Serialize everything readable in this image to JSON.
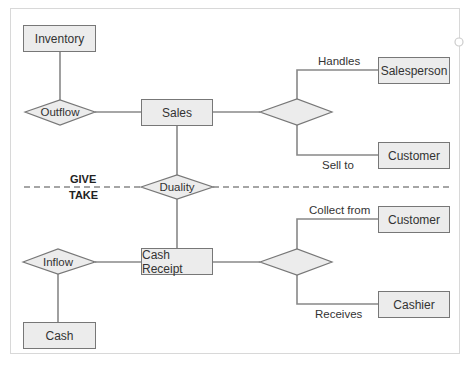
{
  "diagram": {
    "divider": {
      "give_label": "GIVE",
      "take_label": "TAKE"
    },
    "entities": {
      "inventory": "Inventory",
      "sales": "Sales",
      "salesperson": "Salesperson",
      "customer_top": "Customer",
      "cash_receipt": "Cash Receipt",
      "customer_bottom": "Customer",
      "cashier": "Cashier",
      "cash": "Cash"
    },
    "relationships": {
      "outflow": "Outflow",
      "duality": "Duality",
      "inflow": "Inflow",
      "sales_participation": "",
      "receipt_participation": ""
    },
    "edge_labels": {
      "handles": "Handles",
      "sell_to": "Sell to",
      "collect_from": "Collect from",
      "receives": "Receives"
    },
    "colors": {
      "entity_fill": "#ececec",
      "line": "#888888",
      "stroke": "#777777"
    }
  }
}
